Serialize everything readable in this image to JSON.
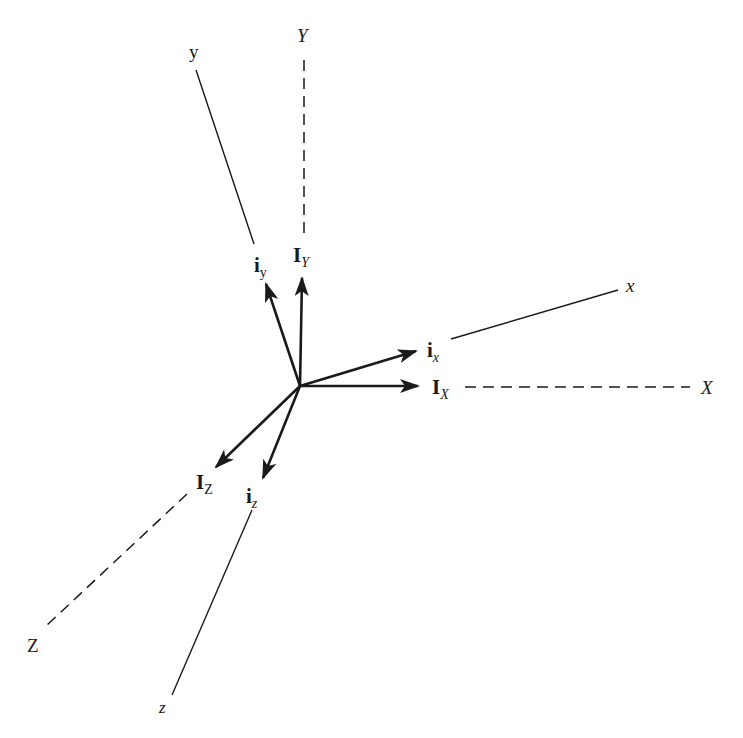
{
  "diagram": {
    "origin": {
      "x": 300,
      "y": 386
    },
    "colors": {
      "line": "#1a1a1a",
      "background": "#ffffff"
    },
    "axes": [
      {
        "id": "y",
        "label": "y",
        "style": "solid",
        "from": [
          254,
          244
        ],
        "to": [
          196,
          70
        ],
        "label_pos": [
          190,
          58
        ]
      },
      {
        "id": "Y",
        "label": "Y",
        "style": "dashed",
        "from": [
          304,
          233
        ],
        "to": [
          304,
          57
        ],
        "label_pos": [
          298,
          42
        ]
      },
      {
        "id": "x",
        "label": "x",
        "style": "solid",
        "from": [
          451,
          339
        ],
        "to": [
          618,
          290
        ],
        "label_pos": [
          627,
          292
        ]
      },
      {
        "id": "X",
        "label": "X",
        "style": "dashed",
        "from": [
          465,
          387
        ],
        "to": [
          690,
          387
        ],
        "label_pos": [
          701,
          393
        ]
      },
      {
        "id": "Z",
        "label": "Z",
        "style": "dashed",
        "from": [
          187,
          494
        ],
        "to": [
          46,
          626
        ],
        "label_pos": [
          28,
          651
        ]
      },
      {
        "id": "z",
        "label": "z",
        "style": "solid",
        "from": [
          252,
          510
        ],
        "to": [
          172,
          695
        ],
        "label_pos": [
          160,
          712
        ]
      }
    ],
    "vectors": [
      {
        "id": "I_Y",
        "base": "I",
        "sub": "Y",
        "to": [
          302,
          278
        ],
        "label_pos": [
          294,
          262
        ]
      },
      {
        "id": "i_y",
        "base": "i",
        "sub": "y",
        "to": [
          266,
          284
        ],
        "label_pos": [
          254,
          272
        ]
      },
      {
        "id": "i_x",
        "base": "i",
        "sub": "x",
        "to": [
          416,
          351
        ],
        "label_pos": [
          427,
          358
        ]
      },
      {
        "id": "I_X",
        "base": "I",
        "sub": "X",
        "to": [
          418,
          386
        ],
        "label_pos": [
          432,
          394
        ]
      },
      {
        "id": "I_Z",
        "base": "I",
        "sub": "Z",
        "to": [
          216,
          467
        ],
        "label_pos": [
          196,
          490
        ]
      },
      {
        "id": "i_z",
        "base": "i",
        "sub": "z",
        "to": [
          263,
          478
        ],
        "label_pos": [
          246,
          504
        ]
      }
    ],
    "labels": {
      "axis_y": "y",
      "axis_Y": "Y",
      "axis_x": "x",
      "axis_X": "X",
      "axis_Z": "Z",
      "axis_z": "z",
      "vec_IY_base": "I",
      "vec_IY_sub": "Y",
      "vec_iy_base": "i",
      "vec_iy_sub": "y",
      "vec_ix_base": "i",
      "vec_ix_sub": "x",
      "vec_IX_base": "I",
      "vec_IX_sub": "X",
      "vec_IZ_base": "I",
      "vec_IZ_sub": "Z",
      "vec_iz_base": "i",
      "vec_iz_sub": "z"
    }
  }
}
